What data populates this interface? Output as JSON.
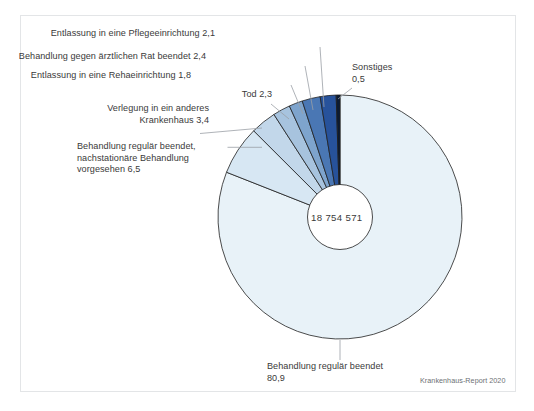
{
  "figure": {
    "center_value": "18 754 571",
    "source": "Krankenhaus-Report 2020",
    "text_color": "#3a3a3a",
    "source_color": "#6c6f73",
    "border_color": "#e3e5e7",
    "leader_color": "#9aa0a6",
    "slice_stroke": "#1f1f1f"
  },
  "chart_data": {
    "type": "pie",
    "title": "",
    "subtitle": "",
    "xlabel": "",
    "ylabel": "",
    "units": "Prozent",
    "total_label": "18 754 571",
    "legend_position": "callout-labels",
    "grid": false,
    "categories": [
      "Behandlung regulär beendet",
      "Behandlung regulär beendet, nachstationäre Behandlung vorgesehen",
      "Verlegung in ein anderes Krankenhaus",
      "Tod",
      "Entlassung in eine Rehaeinrichtung",
      "Behandlung gegen ärztlichen Rat beendet",
      "Entlassung in eine Pflegeeinrichtung",
      "Sonstiges"
    ],
    "values": [
      80.9,
      6.5,
      3.4,
      2.3,
      1.8,
      2.4,
      2.1,
      0.5
    ],
    "value_labels": [
      "80,9",
      "6,5",
      "3,4",
      "2,3",
      "1,8",
      "2,4",
      "2,1",
      "0,5"
    ],
    "colors": [
      "#e8f2f8",
      "#d7e7f3",
      "#c2d7ea",
      "#a7c3de",
      "#7ea4cd",
      "#4a77b4",
      "#27529b",
      "#0b1a33"
    ]
  },
  "labels": {
    "pflege": {
      "line1": "Entlassung in eine Pflegeeinrichtung 2,1"
    },
    "arzt": {
      "line1": "Behandlung gegen ärztlichen Rat beendet 2,4"
    },
    "reha": {
      "line1": "Entlassung in eine Rehaeinrichtung 1,8"
    },
    "tod": {
      "line1": "Tod 2,3"
    },
    "verlegung": {
      "line1": "Verlegung in ein anderes",
      "line2": "Krankenhaus 3,4"
    },
    "nachstationaer": {
      "line1": "Behandlung regulär beendet,",
      "line2": "nachstationäre Behandlung",
      "line3": "vorgesehen 6,5"
    },
    "sonstiges": {
      "line1": "Sonstiges",
      "line2": "0,5"
    },
    "regulaer": {
      "line1": "Behandlung regulär beendet",
      "line2": "80,9"
    }
  }
}
